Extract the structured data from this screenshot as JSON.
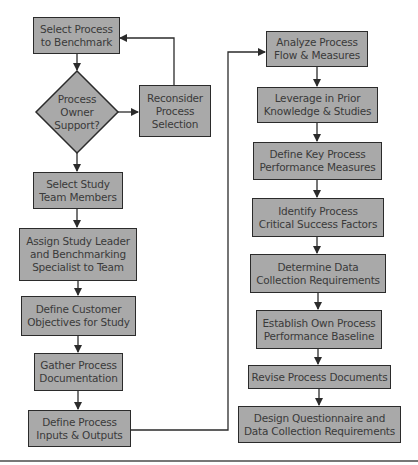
{
  "diagram": {
    "type": "flowchart",
    "colors": {
      "box_fill": "#a9a9a9",
      "box_border": "#2b2b2b",
      "text": "#3a3a3a",
      "line": "#2b2b2b"
    },
    "left_column": [
      {
        "id": "select_process",
        "label": "Select Process\nto Benchmark"
      },
      {
        "id": "owner_support",
        "label": "Process\nOwner\nSupport?",
        "shape": "diamond"
      },
      {
        "id": "reconsider",
        "label": "Reconsider\nProcess\nSelection"
      },
      {
        "id": "select_team",
        "label": "Select Study\nTeam Members"
      },
      {
        "id": "assign_leader",
        "label": "Assign Study Leader\nand Benchmarking\nSpecialist to Team"
      },
      {
        "id": "define_customer",
        "label": "Define Customer\nObjectives for Study"
      },
      {
        "id": "gather_docs",
        "label": "Gather Process\nDocumentation"
      },
      {
        "id": "define_io",
        "label": "Define Process\nInputs & Outputs"
      }
    ],
    "right_column": [
      {
        "id": "analyze_flow",
        "label": "Analyze Process\nFlow & Measures"
      },
      {
        "id": "leverage",
        "label": "Leverage in Prior\nKnowledge & Studies"
      },
      {
        "id": "define_kpm",
        "label": "Define Key Process\nPerformance Measures"
      },
      {
        "id": "identify_csf",
        "label": "Identify Process\nCritical Success Factors"
      },
      {
        "id": "determine_data",
        "label": "Determine Data\nCollection Requirements"
      },
      {
        "id": "establish_baseline",
        "label": "Establish Own Process\nPerformance Baseline"
      },
      {
        "id": "revise_docs",
        "label": "Revise Process Documents"
      },
      {
        "id": "design_questionnaire",
        "label": "Design Questionnaire and\nData Collection Requirements"
      }
    ],
    "edges": [
      [
        "select_process",
        "owner_support"
      ],
      [
        "owner_support",
        "reconsider"
      ],
      [
        "reconsider",
        "select_process"
      ],
      [
        "owner_support",
        "select_team"
      ],
      [
        "select_team",
        "assign_leader"
      ],
      [
        "assign_leader",
        "define_customer"
      ],
      [
        "define_customer",
        "gather_docs"
      ],
      [
        "gather_docs",
        "define_io"
      ],
      [
        "define_io",
        "analyze_flow"
      ],
      [
        "analyze_flow",
        "leverage"
      ],
      [
        "leverage",
        "define_kpm"
      ],
      [
        "define_kpm",
        "identify_csf"
      ],
      [
        "identify_csf",
        "determine_data"
      ],
      [
        "determine_data",
        "establish_baseline"
      ],
      [
        "establish_baseline",
        "revise_docs"
      ],
      [
        "revise_docs",
        "design_questionnaire"
      ]
    ]
  }
}
